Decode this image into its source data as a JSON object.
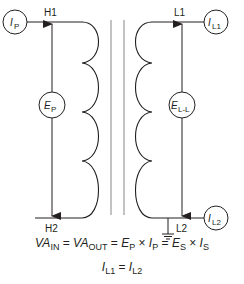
{
  "diagram": {
    "type": "single-phase transformer schematic",
    "primary": {
      "top_terminal": "H1",
      "bottom_terminal": "H2",
      "current_meter": {
        "symbol": "I",
        "subscript": "P"
      },
      "voltage_meter": {
        "symbol": "E",
        "subscript": "P"
      }
    },
    "secondary": {
      "top_terminal": "L1",
      "bottom_terminal": "L2",
      "current_meter_top": {
        "symbol": "I",
        "subscript": "L1"
      },
      "current_meter_bottom": {
        "symbol": "I",
        "subscript": "L2"
      },
      "voltage_meter": {
        "symbol": "E",
        "subscript": "L-L"
      },
      "grounded_terminal": "L2"
    },
    "core": "iron core (two parallel lines)",
    "colors": {
      "line": "#231f20",
      "core": "#9a9a9a",
      "background": "#ffffff"
    }
  },
  "equations": {
    "eq1": {
      "va_in": "VA",
      "va_in_sub": "IN",
      "eq_a": " = ",
      "va_out": "VA",
      "va_out_sub": "OUT",
      "eq_b": " = ",
      "ep": "E",
      "ep_sub": "P",
      "times_a": " × ",
      "ip": "I",
      "ip_sub": "P",
      "eq_c": " = ",
      "es": "E",
      "es_sub": "S",
      "times_b": " × ",
      "is": "I",
      "is_sub": "S"
    },
    "eq2": {
      "il1": "I",
      "il1_sub": "L1",
      "eq": " = ",
      "il2": "I",
      "il2_sub": "L2"
    }
  }
}
